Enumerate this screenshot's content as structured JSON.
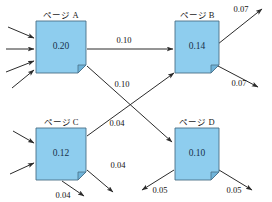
{
  "diagram": {
    "type": "pagerank-graph",
    "title_prefix": "ページ",
    "nodes": [
      {
        "id": "A",
        "title": "ページ A",
        "value": "0.20",
        "x": 36,
        "y": 21,
        "w": 50,
        "h": 52
      },
      {
        "id": "B",
        "title": "ページ B",
        "value": "0.14",
        "x": 175,
        "y": 21,
        "w": 44,
        "h": 52
      },
      {
        "id": "C",
        "title": "ページ C",
        "value": "0.12",
        "x": 36,
        "y": 128,
        "w": 50,
        "h": 52
      },
      {
        "id": "D",
        "title": "ページ D",
        "value": "0.10",
        "x": 175,
        "y": 128,
        "w": 44,
        "h": 52
      }
    ],
    "edges": [
      {
        "from": "A",
        "to": "B",
        "label": "0.10"
      },
      {
        "from": "A",
        "to": "D",
        "label": "0.10"
      },
      {
        "from": "C",
        "to": "B",
        "label": "0.04"
      },
      {
        "from": "C",
        "to": "out-right",
        "label": "0.04"
      },
      {
        "from": "C",
        "to": "out-bottom",
        "label": "0.04"
      },
      {
        "from": "B",
        "to": "out-upper-right",
        "label": "0.07"
      },
      {
        "from": "B",
        "to": "out-lower-right",
        "label": "0.07"
      },
      {
        "from": "D",
        "to": "out-left",
        "label": "0.05"
      },
      {
        "from": "D",
        "to": "out-right",
        "label": "0.05"
      }
    ],
    "incoming_counts": {
      "A": 4,
      "C": 2
    },
    "colors": {
      "node_fill": "#8ecdee",
      "node_stroke": "#4a6f86",
      "fold_fill": "#6fb4da",
      "arrow": "#2b2b2b",
      "value_text": "#17314a",
      "label_text": "#121212",
      "background": "#ffffff"
    }
  }
}
